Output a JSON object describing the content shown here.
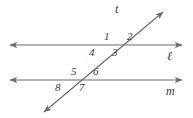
{
  "figure": {
    "background_color": "#ffffff",
    "stroke_color": "#6b6b6b",
    "label_color": "#3a3a3a"
  },
  "lines": {
    "line_l": {
      "name": "l",
      "label": "ℓ",
      "label_x": 167,
      "label_y": 50,
      "x1": 10,
      "y1": 45,
      "x2": 182,
      "y2": 45,
      "arrows": "both"
    },
    "line_m": {
      "name": "m",
      "label": "m",
      "label_x": 166,
      "label_y": 85,
      "x1": 10,
      "y1": 80,
      "x2": 182,
      "y2": 80,
      "arrows": "both"
    },
    "transversal_t": {
      "name": "t",
      "label": "t",
      "label_x": 115,
      "label_y": 3,
      "x1": 44,
      "y1": 112,
      "x2": 163,
      "y2": 12,
      "arrows": "both"
    }
  },
  "intersections": {
    "at_line_l": {
      "x": 110,
      "y": 45
    },
    "at_line_m": {
      "x": 77,
      "y": 80
    }
  },
  "angles": [
    {
      "id": "angle-1",
      "label": "1",
      "x": 104,
      "y": 31
    },
    {
      "id": "angle-2",
      "label": "2",
      "x": 127,
      "y": 31
    },
    {
      "id": "angle-3",
      "label": "3",
      "x": 112,
      "y": 47
    },
    {
      "id": "angle-4",
      "label": "4",
      "x": 89,
      "y": 47
    },
    {
      "id": "angle-5",
      "label": "5",
      "x": 71,
      "y": 66
    },
    {
      "id": "angle-6",
      "label": "6",
      "x": 93,
      "y": 66
    },
    {
      "id": "angle-7",
      "label": "7",
      "x": 79,
      "y": 82
    },
    {
      "id": "angle-8",
      "label": "8",
      "x": 55,
      "y": 82
    }
  ]
}
